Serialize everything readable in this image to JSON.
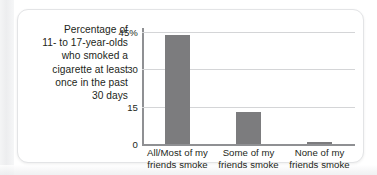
{
  "figure": {
    "caption_lines": [
      "Percentage of",
      "11- to 17-year-olds",
      "who smoked a",
      "cigarette at least",
      "once in the past",
      "30 days"
    ],
    "caption_text": "Percentage of 11- to 17-year-olds who smoked a cigarette at least once in the past 30 days"
  },
  "colors": {
    "bar": "#7c7c7e",
    "gridline": "#d4d5d7",
    "axis": "#8f9093",
    "text": "#231f20",
    "card_background": "#ffffff",
    "card_border": "#e3e4e6"
  },
  "chart_data": {
    "type": "bar",
    "title": "",
    "subtitle": "",
    "xlabel": "",
    "ylabel": "Percentage of 11- to 17-year-olds who smoked a cigarette at least once in the past 30 days",
    "categories": [
      "All/Most of my friends smoke",
      "Some of my friends smoke",
      "None of my friends smoke"
    ],
    "category_lines": [
      [
        "All/Most of my",
        "friends smoke"
      ],
      [
        "Some of my",
        "friends smoke"
      ],
      [
        "None of my",
        "friends smoke"
      ]
    ],
    "values": [
      44,
      13,
      1
    ],
    "ylim": [
      0,
      45
    ],
    "yticks": [
      0,
      15,
      30,
      45
    ],
    "ytick_labels": [
      "0",
      "15",
      "30",
      "45%"
    ],
    "grid": true,
    "legend": "none",
    "orientation": "vertical"
  }
}
